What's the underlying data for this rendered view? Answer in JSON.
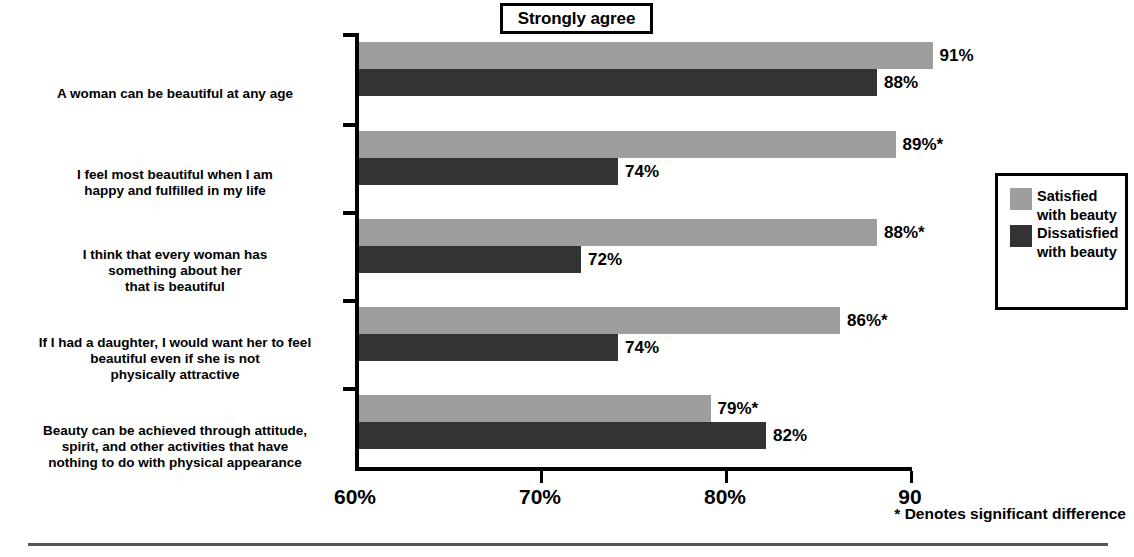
{
  "title": {
    "text": "Strongly agree"
  },
  "axis": {
    "ticks": [
      {
        "label": "60%",
        "value": 60
      },
      {
        "label": "70%",
        "value": 70
      },
      {
        "label": "80%",
        "value": 80
      },
      {
        "label": "90",
        "value": 90
      }
    ]
  },
  "legend": {
    "items": [
      {
        "name": "Satisfied\nwith beauty",
        "color": "#9e9e9e"
      },
      {
        "name": "Dissatisfied\nwith beauty",
        "color": "#333333"
      }
    ]
  },
  "footnote": {
    "text": "* Denotes significant difference"
  },
  "chart_data": {
    "type": "bar",
    "orientation": "horizontal",
    "title": "Strongly agree",
    "xlabel": "",
    "ylabel": "",
    "xlim": [
      60,
      90
    ],
    "grid": false,
    "legend_position": "right",
    "categories": [
      "A woman can be beautiful at any age",
      "I feel most beautiful when I am\nhappy and fulfilled in my life",
      "I think that every woman has\nsomething about her\nthat is beautiful",
      "If I had a daughter, I would want her to feel\nbeautiful even if she is not\nphysically attractive",
      "Beauty can be achieved through attitude,\nspirit, and other activities that have\nnothing to do with physical  appearance"
    ],
    "series": [
      {
        "name": "Satisfied with beauty",
        "color": "#9e9e9e",
        "values": [
          91,
          89,
          88,
          86,
          79
        ],
        "labels": [
          "91%",
          "89%*",
          "88%*",
          "86%*",
          "79%*"
        ]
      },
      {
        "name": "Dissatisfied with beauty",
        "color": "#333333",
        "values": [
          88,
          74,
          72,
          74,
          82
        ],
        "labels": [
          "88%",
          "74%",
          "72%",
          "74%",
          "82%"
        ]
      }
    ],
    "annotations": [
      "* Denotes significant difference"
    ]
  }
}
